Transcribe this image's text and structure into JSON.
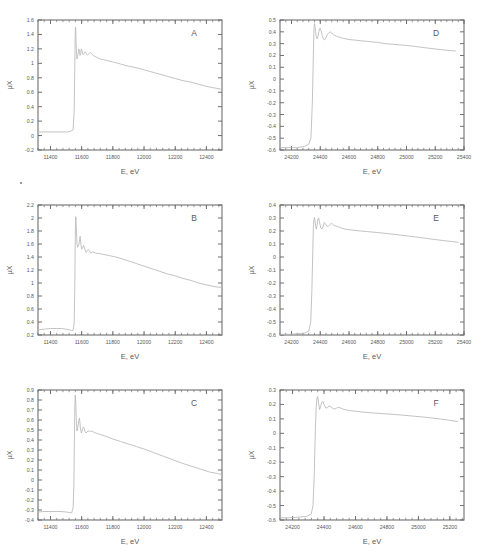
{
  "figure": {
    "name": "xafs-spectra-grid",
    "rows": 3,
    "cols": 2,
    "background": "#ffffff",
    "axis_color": "#6f6f6f",
    "curve_color": "#b8b8b8",
    "text_color": "#5a5a5a"
  },
  "chart_data": [
    {
      "type": "line",
      "panel_label": "A",
      "title": "",
      "xlabel": "E, eV",
      "ylabel": "μX",
      "xlim": [
        11320,
        12500
      ],
      "ylim": [
        -0.2,
        1.6
      ],
      "xticks": [
        11400,
        11600,
        11800,
        12000,
        12200,
        12400
      ],
      "yticks": [
        -0.2,
        0,
        0.2,
        0.4,
        0.6,
        0.8,
        1,
        1.2,
        1.4,
        1.6
      ],
      "grid": false,
      "legend": "none",
      "edge_energy": 11560,
      "x": [
        11320,
        11360,
        11400,
        11440,
        11480,
        11510,
        11530,
        11545,
        11552,
        11556,
        11558,
        11560,
        11562,
        11564,
        11567,
        11570,
        11574,
        11578,
        11582,
        11586,
        11590,
        11594,
        11598,
        11602,
        11606,
        11610,
        11615,
        11620,
        11626,
        11632,
        11638,
        11644,
        11650,
        11656,
        11662,
        11668,
        11674,
        11680,
        11686,
        11692,
        11700,
        11710,
        11720,
        11740,
        11760,
        11800,
        11850,
        11900,
        11950,
        12000,
        12050,
        12100,
        12150,
        12200,
        12250,
        12300,
        12350,
        12400,
        12450,
        12500
      ],
      "y": [
        0.05,
        0.05,
        0.05,
        0.05,
        0.05,
        0.05,
        0.06,
        0.08,
        0.35,
        0.95,
        1.32,
        1.5,
        1.46,
        1.3,
        1.12,
        1.06,
        1.1,
        1.14,
        1.2,
        1.16,
        1.11,
        1.14,
        1.2,
        1.18,
        1.13,
        1.12,
        1.14,
        1.16,
        1.15,
        1.13,
        1.12,
        1.13,
        1.14,
        1.15,
        1.14,
        1.12,
        1.11,
        1.1,
        1.1,
        1.09,
        1.08,
        1.07,
        1.06,
        1.05,
        1.04,
        1.02,
        0.99,
        0.96,
        0.94,
        0.91,
        0.88,
        0.85,
        0.82,
        0.79,
        0.76,
        0.74,
        0.71,
        0.68,
        0.66,
        0.64
      ]
    },
    {
      "type": "line",
      "panel_label": "D",
      "title": "",
      "xlabel": "E, eV",
      "ylabel": "μX",
      "xlim": [
        24120,
        25400
      ],
      "ylim": [
        -0.6,
        0.5
      ],
      "xticks": [
        24200,
        24400,
        24600,
        24800,
        25000,
        25200,
        25400
      ],
      "yticks": [
        -0.6,
        -0.5,
        -0.4,
        -0.3,
        -0.2,
        -0.1,
        0,
        0.1,
        0.2,
        0.3,
        0.4,
        0.5
      ],
      "grid": false,
      "legend": "none",
      "edge_energy": 24350,
      "x": [
        24120,
        24180,
        24240,
        24290,
        24320,
        24335,
        24345,
        24352,
        24356,
        24360,
        24364,
        24368,
        24372,
        24378,
        24384,
        24390,
        24398,
        24406,
        24414,
        24422,
        24430,
        24440,
        24450,
        24460,
        24470,
        24480,
        24490,
        24500,
        24510,
        24520,
        24530,
        24545,
        24560,
        24580,
        24600,
        24640,
        24680,
        24720,
        24760,
        24800,
        24850,
        24900,
        24950,
        25000,
        25050,
        25100,
        25150,
        25200,
        25250,
        25300,
        25340
      ],
      "y": [
        -0.58,
        -0.58,
        -0.58,
        -0.57,
        -0.55,
        -0.5,
        -0.2,
        0.2,
        0.42,
        0.47,
        0.44,
        0.4,
        0.36,
        0.34,
        0.36,
        0.4,
        0.43,
        0.41,
        0.37,
        0.34,
        0.33,
        0.35,
        0.38,
        0.39,
        0.4,
        0.39,
        0.375,
        0.37,
        0.365,
        0.36,
        0.355,
        0.35,
        0.345,
        0.34,
        0.335,
        0.33,
        0.325,
        0.32,
        0.315,
        0.31,
        0.3,
        0.295,
        0.29,
        0.285,
        0.278,
        0.27,
        0.262,
        0.255,
        0.248,
        0.242,
        0.238
      ]
    },
    {
      "type": "line",
      "panel_label": "B",
      "title": "",
      "xlabel": "E, eV",
      "ylabel": "μX",
      "xlim": [
        11320,
        12500
      ],
      "ylim": [
        0.2,
        2.2
      ],
      "xticks": [
        11400,
        11600,
        11800,
        12000,
        12200,
        12400
      ],
      "yticks": [
        0.2,
        0.4,
        0.6,
        0.8,
        1,
        1.2,
        1.4,
        1.6,
        1.8,
        2,
        2.2
      ],
      "grid": false,
      "legend": "none",
      "edge_energy": 11560,
      "x": [
        11320,
        11360,
        11400,
        11440,
        11470,
        11500,
        11520,
        11535,
        11545,
        11552,
        11556,
        11559,
        11562,
        11566,
        11570,
        11575,
        11580,
        11585,
        11590,
        11595,
        11600,
        11606,
        11612,
        11618,
        11624,
        11630,
        11636,
        11642,
        11648,
        11654,
        11660,
        11666,
        11672,
        11680,
        11690,
        11700,
        11720,
        11740,
        11780,
        11820,
        11860,
        11900,
        11950,
        12000,
        12050,
        12100,
        12150,
        12200,
        12250,
        12300,
        12350,
        12400,
        12450,
        12500
      ],
      "y": [
        0.28,
        0.29,
        0.3,
        0.3,
        0.3,
        0.29,
        0.28,
        0.27,
        0.27,
        0.38,
        0.95,
        1.7,
        2.02,
        1.85,
        1.6,
        1.55,
        1.58,
        1.62,
        1.72,
        1.6,
        1.52,
        1.54,
        1.58,
        1.54,
        1.49,
        1.47,
        1.5,
        1.52,
        1.5,
        1.47,
        1.46,
        1.47,
        1.48,
        1.47,
        1.46,
        1.455,
        1.45,
        1.44,
        1.42,
        1.4,
        1.37,
        1.34,
        1.3,
        1.26,
        1.22,
        1.18,
        1.14,
        1.11,
        1.07,
        1.04,
        1.0,
        0.97,
        0.945,
        0.93
      ]
    },
    {
      "type": "line",
      "panel_label": "E",
      "title": "",
      "xlabel": "E, eV",
      "ylabel": "μX",
      "xlim": [
        24120,
        25400
      ],
      "ylim": [
        -0.6,
        0.4
      ],
      "xticks": [
        24200,
        24400,
        24600,
        24800,
        25000,
        25200,
        25400
      ],
      "yticks": [
        -0.6,
        -0.5,
        -0.4,
        -0.3,
        -0.2,
        -0.1,
        0,
        0.1,
        0.2,
        0.3,
        0.4
      ],
      "grid": false,
      "legend": "none",
      "edge_energy": 24350,
      "x": [
        24120,
        24180,
        24240,
        24290,
        24320,
        24334,
        24342,
        24348,
        24352,
        24356,
        24360,
        24366,
        24372,
        24378,
        24384,
        24390,
        24396,
        24404,
        24412,
        24420,
        24428,
        24436,
        24446,
        24456,
        24466,
        24476,
        24486,
        24496,
        24508,
        24520,
        24535,
        24550,
        24570,
        24600,
        24640,
        24680,
        24720,
        24760,
        24800,
        24850,
        24900,
        24960,
        25020,
        25080,
        25140,
        25200,
        25260,
        25320,
        25360
      ],
      "y": [
        -0.595,
        -0.595,
        -0.59,
        -0.585,
        -0.57,
        -0.5,
        -0.25,
        0.05,
        0.22,
        0.29,
        0.305,
        0.255,
        0.215,
        0.245,
        0.295,
        0.3,
        0.26,
        0.225,
        0.215,
        0.235,
        0.265,
        0.255,
        0.238,
        0.235,
        0.248,
        0.258,
        0.252,
        0.243,
        0.238,
        0.235,
        0.228,
        0.222,
        0.215,
        0.21,
        0.205,
        0.2,
        0.196,
        0.192,
        0.188,
        0.182,
        0.176,
        0.168,
        0.16,
        0.152,
        0.143,
        0.134,
        0.126,
        0.118,
        0.113
      ]
    },
    {
      "type": "line",
      "panel_label": "C",
      "title": "",
      "xlabel": "E, eV",
      "ylabel": "μX",
      "xlim": [
        11320,
        12500
      ],
      "ylim": [
        -0.4,
        0.9
      ],
      "xticks": [
        11400,
        11600,
        11800,
        12000,
        12200,
        12400
      ],
      "yticks": [
        -0.4,
        -0.3,
        -0.2,
        -0.1,
        0,
        0.1,
        0.2,
        0.3,
        0.4,
        0.5,
        0.6,
        0.7,
        0.8,
        0.9
      ],
      "grid": false,
      "legend": "none",
      "edge_energy": 11555,
      "x": [
        11320,
        11360,
        11400,
        11440,
        11470,
        11500,
        11520,
        11535,
        11545,
        11550,
        11553,
        11556,
        11559,
        11562,
        11566,
        11570,
        11575,
        11580,
        11586,
        11592,
        11598,
        11604,
        11610,
        11616,
        11622,
        11628,
        11634,
        11640,
        11648,
        11656,
        11664,
        11672,
        11680,
        11690,
        11700,
        11720,
        11750,
        11800,
        11850,
        11900,
        11950,
        12000,
        12060,
        12120,
        12180,
        12240,
        12300,
        12360,
        12420,
        12470,
        12500
      ],
      "y": [
        -0.32,
        -0.315,
        -0.315,
        -0.315,
        -0.315,
        -0.32,
        -0.325,
        -0.33,
        -0.28,
        -0.05,
        0.35,
        0.72,
        0.85,
        0.78,
        0.58,
        0.49,
        0.52,
        0.58,
        0.62,
        0.52,
        0.47,
        0.5,
        0.53,
        0.52,
        0.48,
        0.47,
        0.48,
        0.49,
        0.49,
        0.485,
        0.49,
        0.485,
        0.475,
        0.47,
        0.465,
        0.455,
        0.44,
        0.41,
        0.385,
        0.36,
        0.335,
        0.31,
        0.275,
        0.24,
        0.205,
        0.17,
        0.14,
        0.11,
        0.08,
        0.065,
        0.055
      ]
    },
    {
      "type": "line",
      "panel_label": "F",
      "title": "",
      "xlabel": "E, eV",
      "ylabel": "μX",
      "xlim": [
        24120,
        25290
      ],
      "ylim": [
        -0.6,
        0.3
      ],
      "xticks": [
        24200,
        24400,
        24600,
        24800,
        25000,
        25200
      ],
      "yticks": [
        -0.6,
        -0.5,
        -0.4,
        -0.3,
        -0.2,
        -0.1,
        0,
        0.1,
        0.2,
        0.3
      ],
      "grid": false,
      "legend": "none",
      "edge_energy": 24350,
      "x": [
        24120,
        24180,
        24240,
        24290,
        24318,
        24330,
        24338,
        24345,
        24350,
        24355,
        24360,
        24366,
        24372,
        24378,
        24386,
        24394,
        24402,
        24412,
        24422,
        24432,
        24444,
        24456,
        24468,
        24480,
        24492,
        24506,
        24520,
        24536,
        24552,
        24570,
        24600,
        24640,
        24690,
        24740,
        24790,
        24840,
        24900,
        24960,
        25020,
        25080,
        25140,
        25200,
        25250
      ],
      "y": [
        -0.585,
        -0.585,
        -0.58,
        -0.575,
        -0.56,
        -0.5,
        -0.28,
        0.03,
        0.18,
        0.245,
        0.255,
        0.205,
        0.165,
        0.185,
        0.215,
        0.22,
        0.195,
        0.175,
        0.178,
        0.19,
        0.183,
        0.172,
        0.168,
        0.175,
        0.18,
        0.175,
        0.168,
        0.163,
        0.16,
        0.157,
        0.153,
        0.148,
        0.143,
        0.139,
        0.135,
        0.131,
        0.126,
        0.12,
        0.114,
        0.107,
        0.099,
        0.09,
        0.082
      ]
    }
  ]
}
